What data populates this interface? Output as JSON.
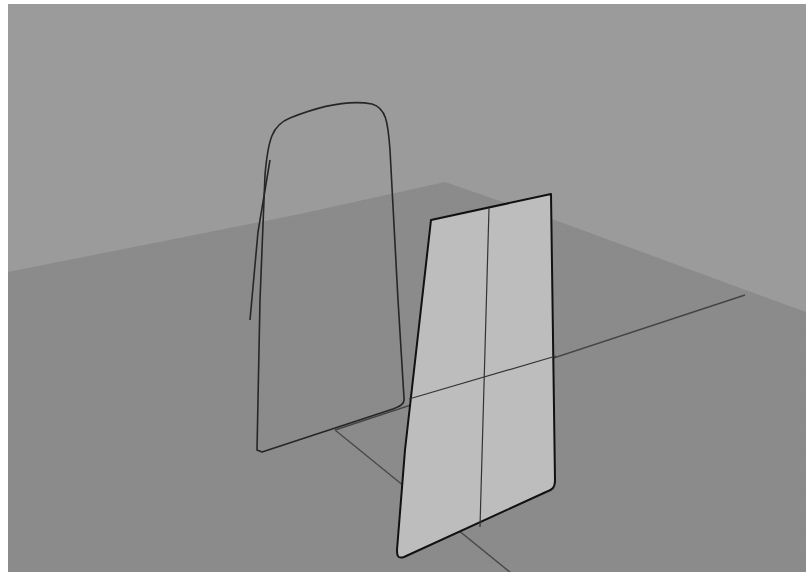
{
  "viewport": {
    "view": "perspective",
    "colors": {
      "background": "#9b9b9b",
      "ground_plane": "#8b8b8b",
      "grid_line": "#838383",
      "axis_x": "#444444",
      "axis_y": "#4a4a4a",
      "curve": "#262626",
      "surface_fill": "#bdbdbd",
      "surface_edge": "#111111",
      "isocurve": "#333333"
    },
    "objects": [
      {
        "name": "open-curve",
        "type": "curve"
      },
      {
        "name": "planar-surface",
        "type": "surface"
      }
    ]
  }
}
